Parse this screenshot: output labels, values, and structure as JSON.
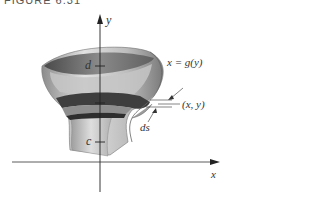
{
  "figure": {
    "caption": "FIGURE 6.31"
  },
  "axes": {
    "y_label": "y",
    "x_label": "x"
  },
  "annotations": {
    "d_label": "d",
    "c_label": "c",
    "curve_label": "x = g(y)",
    "point_label": "(x, y)",
    "arc_label": "ds"
  },
  "colors": {
    "surface_light": "#d4d4d4",
    "surface_mid": "#a8a8a8",
    "surface_dark": "#555555",
    "axis": "#222222"
  }
}
